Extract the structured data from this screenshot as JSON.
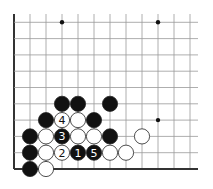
{
  "board": {
    "origin_x": 14,
    "origin_y": 169,
    "spacing_x": 16,
    "spacing_y": 16.3,
    "cols": 12,
    "rows": 10,
    "line_color": "#999999",
    "edge_color": "#333333",
    "star_points": [
      [
        3,
        9
      ],
      [
        9,
        9
      ],
      [
        9,
        3
      ]
    ],
    "stones": [
      {
        "col": 1,
        "row": 0,
        "color": "black",
        "label": ""
      },
      {
        "col": 2,
        "row": 0,
        "color": "white",
        "label": ""
      },
      {
        "col": 1,
        "row": 1,
        "color": "black",
        "label": ""
      },
      {
        "col": 2,
        "row": 1,
        "color": "white",
        "label": ""
      },
      {
        "col": 3,
        "row": 1,
        "color": "white",
        "label": "2"
      },
      {
        "col": 4,
        "row": 1,
        "color": "black",
        "label": "1"
      },
      {
        "col": 5,
        "row": 1,
        "color": "black",
        "label": "5"
      },
      {
        "col": 6,
        "row": 1,
        "color": "white",
        "label": ""
      },
      {
        "col": 7,
        "row": 1,
        "color": "white",
        "label": ""
      },
      {
        "col": 1,
        "row": 2,
        "color": "black",
        "label": ""
      },
      {
        "col": 2,
        "row": 2,
        "color": "white",
        "label": ""
      },
      {
        "col": 3,
        "row": 2,
        "color": "black",
        "label": "3"
      },
      {
        "col": 4,
        "row": 2,
        "color": "white",
        "label": ""
      },
      {
        "col": 5,
        "row": 2,
        "color": "white",
        "label": ""
      },
      {
        "col": 6,
        "row": 2,
        "color": "black",
        "label": ""
      },
      {
        "col": 8,
        "row": 2,
        "color": "white",
        "label": ""
      },
      {
        "col": 2,
        "row": 3,
        "color": "black",
        "label": ""
      },
      {
        "col": 3,
        "row": 3,
        "color": "white",
        "label": "4"
      },
      {
        "col": 4,
        "row": 3,
        "color": "white",
        "label": ""
      },
      {
        "col": 5,
        "row": 3,
        "color": "black",
        "label": ""
      },
      {
        "col": 3,
        "row": 4,
        "color": "black",
        "label": ""
      },
      {
        "col": 4,
        "row": 4,
        "color": "black",
        "label": ""
      },
      {
        "col": 6,
        "row": 4,
        "color": "black",
        "label": ""
      }
    ]
  }
}
